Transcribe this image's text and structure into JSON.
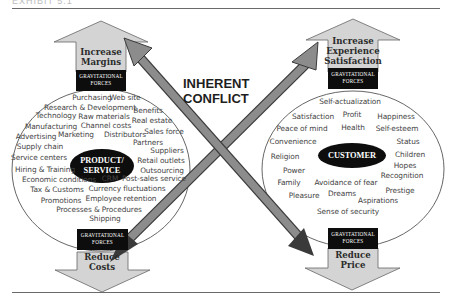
{
  "header": {
    "cropped_text": "EXHIBIT 5.1"
  },
  "center": {
    "line1": "INHERENT",
    "line2": "CONFLICT"
  },
  "colors": {
    "arrow_fill_light": "#d4d4d4",
    "arrow_fill_dark": "#808080",
    "core_fill": "#0d0d0d",
    "outline": "#555555"
  },
  "left": {
    "up_arrow": {
      "line1": "Increase",
      "line2": "Margins"
    },
    "top_forces": {
      "line1": "GRAVITATIONAL",
      "line2": "FORCES"
    },
    "core": {
      "line1": "PRODUCT/",
      "line2": "SERVICE"
    },
    "bottom_forces": {
      "line1": "GRAVITATIONAL",
      "line2": "FORCES"
    },
    "down_arrow": {
      "line1": "Reduce",
      "line2": "Costs"
    },
    "words": [
      {
        "text": "Purchasing",
        "x": 92,
        "y": 97
      },
      {
        "text": "Web site",
        "x": 125,
        "y": 97
      },
      {
        "text": "Research & Development",
        "x": 90,
        "y": 107
      },
      {
        "text": "Benefits",
        "x": 148,
        "y": 110
      },
      {
        "text": "Technology",
        "x": 56,
        "y": 115
      },
      {
        "text": "Raw materials",
        "x": 104,
        "y": 116
      },
      {
        "text": "Real estate",
        "x": 152,
        "y": 120
      },
      {
        "text": "Manufacturing",
        "x": 51,
        "y": 126
      },
      {
        "text": "Channel costs",
        "x": 106,
        "y": 125
      },
      {
        "text": "Sales force",
        "x": 164,
        "y": 131
      },
      {
        "text": "Advertising",
        "x": 36,
        "y": 136
      },
      {
        "text": "Marketing",
        "x": 76,
        "y": 134
      },
      {
        "text": "Distributors",
        "x": 125,
        "y": 134
      },
      {
        "text": "Partners",
        "x": 148,
        "y": 142
      },
      {
        "text": "Supply chain",
        "x": 40,
        "y": 146
      },
      {
        "text": "Suppliers",
        "x": 167,
        "y": 150
      },
      {
        "text": "Service centers",
        "x": 39,
        "y": 157
      },
      {
        "text": "Retail outlets",
        "x": 161,
        "y": 160
      },
      {
        "text": "Hiring & Training",
        "x": 45,
        "y": 169
      },
      {
        "text": "Outsourcing",
        "x": 162,
        "y": 170
      },
      {
        "text": "Economic conditions",
        "x": 59,
        "y": 179
      },
      {
        "text": "CRM",
        "x": 110,
        "y": 178
      },
      {
        "text": "Post-sales service",
        "x": 154,
        "y": 178
      },
      {
        "text": "Tax & Customs",
        "x": 57,
        "y": 189
      },
      {
        "text": "Currency fluctuations",
        "x": 127,
        "y": 188
      },
      {
        "text": "Promotions",
        "x": 61,
        "y": 200
      },
      {
        "text": "Employee retention",
        "x": 121,
        "y": 198
      },
      {
        "text": "Processes & Procedures",
        "x": 99,
        "y": 209
      },
      {
        "text": "Shipping",
        "x": 105,
        "y": 218
      }
    ]
  },
  "right": {
    "up_arrow": {
      "line1": "Increase",
      "line2": "Experience",
      "line3": "Satisfaction"
    },
    "top_forces": {
      "line1": "GRAVITATIONAL",
      "line2": "FORCES"
    },
    "core": {
      "label": "CUSTOMER"
    },
    "bottom_forces": {
      "line1": "GRAVITATIONAL",
      "line2": "FORCES"
    },
    "down_arrow": {
      "line1": "Reduce",
      "line2": "Price"
    },
    "words": [
      {
        "text": "Self-actualization",
        "x": 350,
        "y": 101
      },
      {
        "text": "Satisfaction",
        "x": 313,
        "y": 116
      },
      {
        "text": "Profit",
        "x": 352,
        "y": 114
      },
      {
        "text": "Happiness",
        "x": 396,
        "y": 116
      },
      {
        "text": "Peace of mind",
        "x": 302,
        "y": 128
      },
      {
        "text": "Health",
        "x": 353,
        "y": 127
      },
      {
        "text": "Self-esteem",
        "x": 397,
        "y": 128
      },
      {
        "text": "Convenience",
        "x": 293,
        "y": 141
      },
      {
        "text": "Status",
        "x": 408,
        "y": 141
      },
      {
        "text": "Religion",
        "x": 285,
        "y": 156
      },
      {
        "text": "Children",
        "x": 410,
        "y": 154
      },
      {
        "text": "Hopes",
        "x": 405,
        "y": 165
      },
      {
        "text": "Power",
        "x": 294,
        "y": 170
      },
      {
        "text": "Recognition",
        "x": 402,
        "y": 175
      },
      {
        "text": "Family",
        "x": 289,
        "y": 182
      },
      {
        "text": "Avoidance of fear",
        "x": 346,
        "y": 182
      },
      {
        "text": "Prestige",
        "x": 400,
        "y": 190
      },
      {
        "text": "Pleasure",
        "x": 304,
        "y": 195
      },
      {
        "text": "Dreams",
        "x": 342,
        "y": 193
      },
      {
        "text": "Aspirations",
        "x": 378,
        "y": 200
      },
      {
        "text": "Sense of security",
        "x": 348,
        "y": 211
      }
    ]
  }
}
